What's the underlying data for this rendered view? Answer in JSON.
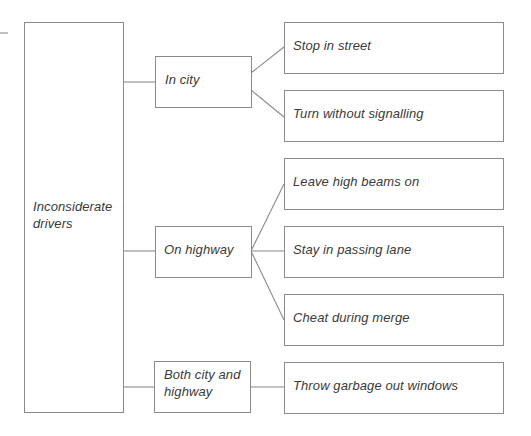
{
  "diagram": {
    "type": "tree",
    "line_color": "#8a8a8a",
    "text_color": "#3a3a3a",
    "root": {
      "label_line1": "Inconsiderate",
      "label_line2": "drivers"
    },
    "categories": [
      {
        "label_line1": "In city",
        "label_line2": "",
        "children": [
          "Stop in street",
          "Turn without signalling"
        ]
      },
      {
        "label_line1": "On highway",
        "label_line2": "",
        "children": [
          "Leave high beams on",
          "Stay in passing lane",
          "Cheat during merge"
        ]
      },
      {
        "label_line1": "Both city and",
        "label_line2": "highway",
        "children": [
          "Throw garbage out windows"
        ]
      }
    ],
    "leaves": [
      "Stop in street",
      "Turn without signalling",
      "Leave high beams on",
      "Stay in passing lane",
      "Cheat during merge",
      "Throw garbage out windows"
    ]
  }
}
